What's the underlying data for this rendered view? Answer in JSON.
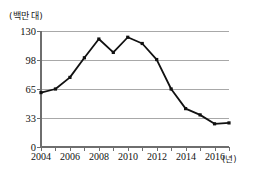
{
  "chart_data": {
    "type": "line",
    "title": "",
    "xlabel": "(년)",
    "ylabel": "(백만 대)",
    "unit_label": "(백만 대)",
    "x_unit_label": "(년)",
    "x": [
      2004,
      2005,
      2006,
      2007,
      2008,
      2009,
      2010,
      2011,
      2012,
      2013,
      2014,
      2015,
      2016,
      2017
    ],
    "values": [
      61,
      65,
      78,
      100,
      121,
      106,
      123,
      116,
      98,
      65,
      43,
      36,
      26,
      27
    ],
    "series": [
      {
        "name": "",
        "values": [
          61,
          65,
          78,
          100,
          121,
          106,
          123,
          116,
          98,
          65,
          43,
          36,
          26,
          27
        ]
      }
    ],
    "ytick_labels": [
      "0",
      "33",
      "65",
      "98",
      "130"
    ],
    "ytick_values": [
      0,
      33,
      65,
      98,
      130
    ],
    "xtick_labels": [
      "2004",
      "2006",
      "2008",
      "2010",
      "2012",
      "2014",
      "2016"
    ],
    "xtick_values": [
      2004,
      2006,
      2008,
      2010,
      2012,
      2014,
      2016
    ],
    "ylim": [
      0,
      130
    ],
    "xlim": [
      2004,
      2017
    ],
    "grid": true,
    "legend": false,
    "marker": "filled-square",
    "line_color": "#111111",
    "grid_color": "#a8a8a8",
    "axis_color": "#6e6e6e"
  }
}
